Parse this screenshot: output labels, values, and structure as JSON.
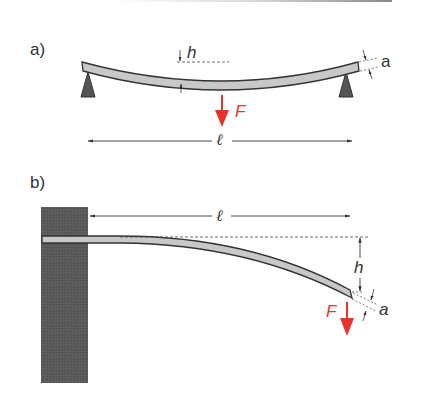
{
  "figure": {
    "colors": {
      "beam_fill": "#c8c8c8",
      "beam_stroke": "#333333",
      "support_fill": "#555555",
      "wall_fill": "#5a5a5a",
      "force_arrow": "#e8322c",
      "dimension_line": "#333333",
      "top_rule": "#9a9a9a"
    },
    "panels": [
      {
        "label": "a)",
        "description": "simply supported beam with central load",
        "symbols": {
          "deflection": "h",
          "thickness": "a",
          "force": "F",
          "length": "ℓ"
        }
      },
      {
        "label": "b)",
        "description": "cantilever beam with end load",
        "symbols": {
          "deflection": "h",
          "thickness": "a",
          "force": "F",
          "length": "ℓ"
        }
      }
    ]
  }
}
